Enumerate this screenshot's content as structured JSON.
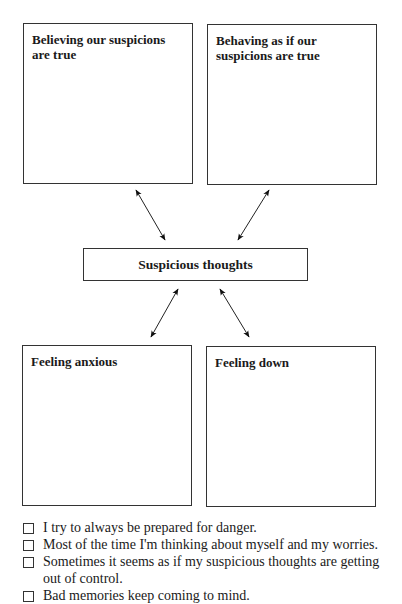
{
  "diagram": {
    "boxes": {
      "believing": "Believing our suspicions are true",
      "behaving": "Behaving as if our suspicions are true",
      "center": "Suspicious thoughts",
      "anxious": "Feeling anxious",
      "down": "Feeling down"
    },
    "arrows": [
      {
        "from": "center",
        "to": "believing",
        "type": "bidirectional"
      },
      {
        "from": "center",
        "to": "behaving",
        "type": "bidirectional"
      },
      {
        "from": "center",
        "to": "anxious",
        "type": "bidirectional"
      },
      {
        "from": "center",
        "to": "down",
        "type": "bidirectional"
      }
    ]
  },
  "checklist": [
    {
      "text": "I try to always be prepared for danger.",
      "checked": false
    },
    {
      "text": "Most of the time I'm thinking about myself and my worries.",
      "checked": false
    },
    {
      "text": "Sometimes it seems as if my suspicious thoughts are getting out of control.",
      "checked": false
    },
    {
      "text": "Bad memories keep coming to mind.",
      "checked": false
    }
  ]
}
